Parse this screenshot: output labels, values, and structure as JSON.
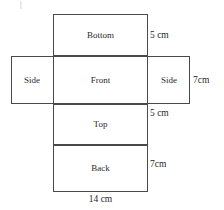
{
  "figure": {
    "stroke_color": "#4a4a4a",
    "text_color": "#2b2b2b",
    "background": "#ffffff",
    "artifact_text": "|"
  },
  "faces": [
    {
      "id": "bottom",
      "label": "Bottom"
    },
    {
      "id": "side_left",
      "label": "Side"
    },
    {
      "id": "front",
      "label": "Front"
    },
    {
      "id": "side_right",
      "label": "Side"
    },
    {
      "id": "top",
      "label": "Top"
    },
    {
      "id": "back",
      "label": "Back"
    }
  ],
  "dimensions": [
    {
      "id": "bottom_height",
      "label": "5 cm"
    },
    {
      "id": "band_height",
      "label": "7cm"
    },
    {
      "id": "top_height",
      "label": "5 cm"
    },
    {
      "id": "back_height",
      "label": "7cm"
    },
    {
      "id": "width",
      "label": "14 cm"
    }
  ]
}
